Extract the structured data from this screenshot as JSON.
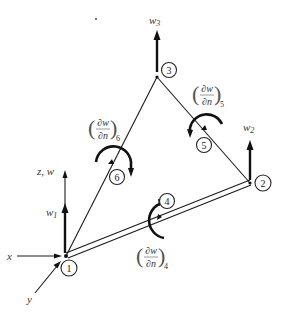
{
  "figure": {
    "axes": {
      "z_label": "z, w",
      "x_label": "x",
      "y_label": "y"
    },
    "corner_nodes": [
      {
        "id": "1",
        "dof_label": "w",
        "dof_sub": "1"
      },
      {
        "id": "2",
        "dof_label": "w",
        "dof_sub": "2"
      },
      {
        "id": "3",
        "dof_label": "w",
        "dof_sub": "3"
      }
    ],
    "midside_nodes": [
      {
        "id": "4",
        "num": "∂w",
        "den": "∂n",
        "sub": "4"
      },
      {
        "id": "5",
        "num": "∂w",
        "den": "∂n",
        "sub": "5"
      },
      {
        "id": "6",
        "num": "∂w",
        "den": "∂n",
        "sub": "6"
      }
    ],
    "colors": {
      "ink": "#111111",
      "background": "#ffffff"
    }
  }
}
